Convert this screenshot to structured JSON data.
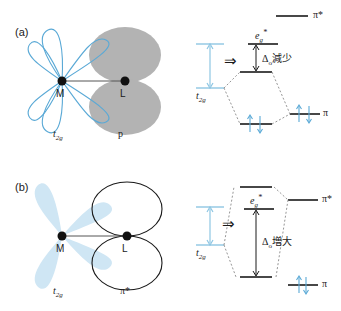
{
  "figure": {
    "panels": [
      {
        "tag": "(a)",
        "orbital_diagram": {
          "metal_label": "M",
          "ligand_label": "L",
          "metal_orbital_label": "t2g",
          "metal_orbital_label_base": "t",
          "metal_orbital_label_sub": "2g",
          "ligand_orbital_label": "p",
          "metal_orbital_style": "outline-blue-four-lobe",
          "ligand_orbital_style": "filled-gray-two-lobe"
        },
        "energy_diagram": {
          "top_level_label": "π*",
          "eg_label_base": "e",
          "eg_label_sub": "g",
          "eg_label_sup": "*",
          "t2g_bracket_label_base": "t",
          "t2g_bracket_label_sub": "2g",
          "delta_symbol": "Δ",
          "delta_sub": "o",
          "delta_text": "減少",
          "pi_level_label": "π",
          "arrow_glyph": "⇒",
          "electron_pairs": [
            {
              "location": "bonding-level",
              "count": 2
            },
            {
              "location": "pi-level",
              "count": 2
            }
          ]
        }
      },
      {
        "tag": "(b)",
        "orbital_diagram": {
          "metal_label": "M",
          "ligand_label": "L",
          "metal_orbital_label": "t2g",
          "metal_orbital_label_base": "t",
          "metal_orbital_label_sub": "2g",
          "ligand_orbital_label": "π*",
          "metal_orbital_style": "filled-lightblue-four-lobe",
          "ligand_orbital_style": "outline-black-two-lobe"
        },
        "energy_diagram": {
          "eg_label_base": "e",
          "eg_label_sub": "g",
          "eg_label_sup": "*",
          "t2g_bracket_label_base": "t",
          "t2g_bracket_label_sub": "2g",
          "delta_symbol": "Δ",
          "delta_sub": "o",
          "delta_text": "増大",
          "pi_star_level_label": "π*",
          "pi_level_label": "π",
          "arrow_glyph": "⇒",
          "electron_pairs": [
            {
              "location": "pi-level",
              "count": 2
            }
          ]
        }
      }
    ]
  },
  "colors": {
    "accent_blue": "#5aa9d6",
    "fill_lightblue": "#cfe6f4",
    "gray_fill": "#b3b3b3",
    "line_black": "#1a1a1a",
    "dash_gray": "#8a8a8a"
  }
}
